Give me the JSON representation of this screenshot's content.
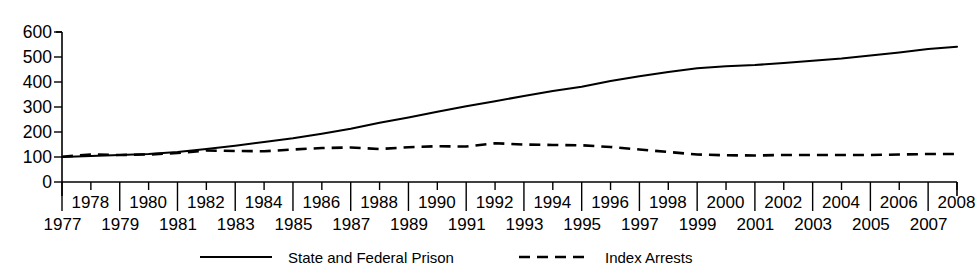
{
  "chart_data": {
    "type": "line",
    "title": "",
    "xlabel": "",
    "ylabel": "",
    "ylim": [
      0,
      600
    ],
    "yticks": [
      0,
      100,
      200,
      300,
      400,
      500,
      600
    ],
    "grid": false,
    "legend_position": "bottom-center",
    "x": [
      1977,
      1978,
      1979,
      1980,
      1981,
      1982,
      1983,
      1984,
      1985,
      1986,
      1987,
      1988,
      1989,
      1990,
      1991,
      1992,
      1993,
      1994,
      1995,
      1996,
      1997,
      1998,
      1999,
      2000,
      2001,
      2002,
      2003,
      2004,
      2005,
      2006,
      2007,
      2008
    ],
    "x_labels_top": [
      "1978",
      "1980",
      "1982",
      "1984",
      "1986",
      "1988",
      "1990",
      "1992",
      "1994",
      "1996",
      "1998",
      "2000",
      "2002",
      "2004",
      "2006",
      "2008"
    ],
    "x_labels_bottom": [
      "1977",
      "1979",
      "1981",
      "1983",
      "1985",
      "1987",
      "1989",
      "1991",
      "1993",
      "1995",
      "1997",
      "1999",
      "2001",
      "2003",
      "2005",
      "2007"
    ],
    "series": [
      {
        "name": "State and Federal Prison",
        "style": "solid",
        "color": "#000000",
        "values": [
          100,
          104,
          108,
          112,
          120,
          132,
          145,
          160,
          175,
          193,
          213,
          237,
          258,
          281,
          303,
          323,
          344,
          364,
          381,
          404,
          423,
          440,
          455,
          463,
          468,
          476,
          485,
          494,
          506,
          518,
          532,
          541
        ]
      },
      {
        "name": "Index Arrests",
        "style": "dashed",
        "color": "#000000",
        "values": [
          101,
          110,
          108,
          110,
          116,
          126,
          124,
          123,
          130,
          136,
          138,
          132,
          139,
          143,
          142,
          155,
          150,
          148,
          147,
          140,
          130,
          120,
          110,
          107,
          106,
          108,
          108,
          108,
          108,
          110,
          112,
          112
        ]
      }
    ]
  },
  "legend": {
    "items": [
      {
        "label": "State and Federal Prison",
        "style": "solid"
      },
      {
        "label": "Index Arrests",
        "style": "dashed"
      }
    ]
  }
}
